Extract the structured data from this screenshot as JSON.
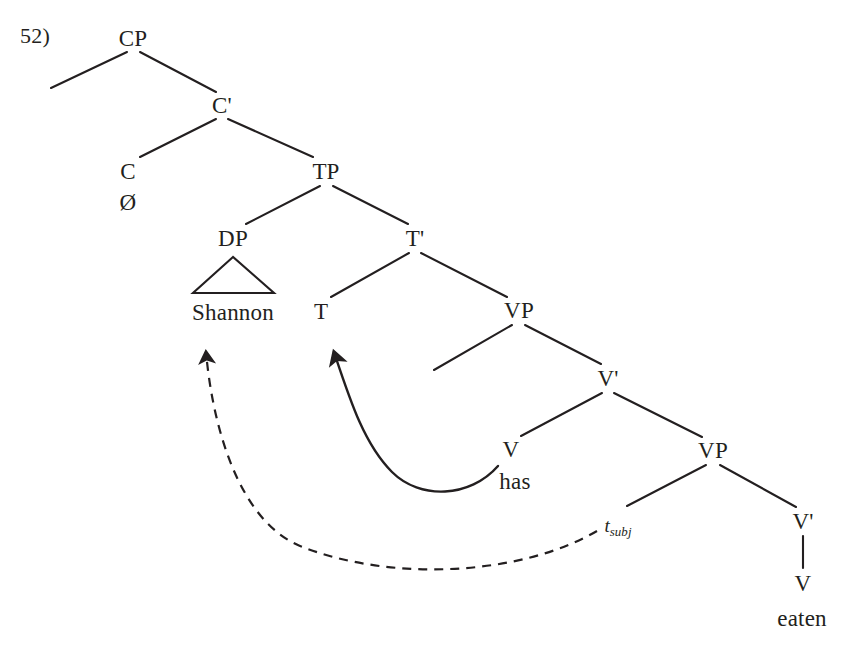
{
  "figure": {
    "example_number": "52)",
    "background_color": "#ffffff",
    "ink_color": "#231f20",
    "width": 843,
    "height": 660
  },
  "tree": {
    "nodes": [
      {
        "id": "cp",
        "label": "CP",
        "x": 133,
        "y": 38
      },
      {
        "id": "cbar",
        "label": "C'",
        "x": 222,
        "y": 105
      },
      {
        "id": "c",
        "label": "C",
        "x": 128,
        "y": 171
      },
      {
        "id": "c-null",
        "label": "Ø",
        "x": 128,
        "y": 202
      },
      {
        "id": "tp",
        "label": "TP",
        "x": 326,
        "y": 171
      },
      {
        "id": "dp",
        "label": "DP",
        "x": 233,
        "y": 238
      },
      {
        "id": "shannon",
        "label": "Shannon",
        "x": 233,
        "y": 312
      },
      {
        "id": "tbar",
        "label": "T'",
        "x": 415,
        "y": 238
      },
      {
        "id": "t",
        "label": "T",
        "x": 321,
        "y": 311
      },
      {
        "id": "vp1",
        "label": "VP",
        "x": 519,
        "y": 310
      },
      {
        "id": "vbar1",
        "label": "V'",
        "x": 608,
        "y": 378
      },
      {
        "id": "v1",
        "label": "V",
        "x": 511,
        "y": 449
      },
      {
        "id": "has",
        "label": "has",
        "x": 515,
        "y": 481
      },
      {
        "id": "vp2",
        "label": "VP",
        "x": 713,
        "y": 450
      },
      {
        "id": "t-subj",
        "label": "t",
        "subscript": "subj",
        "x": 618,
        "y": 526
      },
      {
        "id": "vbar2",
        "label": "V'",
        "x": 803,
        "y": 521
      },
      {
        "id": "v2",
        "label": "V",
        "x": 803,
        "y": 583
      },
      {
        "id": "eaten",
        "label": "eaten",
        "x": 802,
        "y": 618
      }
    ],
    "branches": [
      {
        "id": "cp-spec",
        "from": "cp",
        "to_point": [
          51,
          88
        ],
        "kind": "empty-specifier"
      },
      {
        "id": "cp-cbar",
        "from": "cp",
        "to": "cbar"
      },
      {
        "id": "cbar-c",
        "from": "cbar",
        "to": "c"
      },
      {
        "id": "cbar-tp",
        "from": "cbar",
        "to": "tp"
      },
      {
        "id": "tp-dp",
        "from": "tp",
        "to": "dp"
      },
      {
        "id": "tp-tbar",
        "from": "tp",
        "to": "tbar"
      },
      {
        "id": "tbar-t",
        "from": "tbar",
        "to": "t"
      },
      {
        "id": "tbar-vp1",
        "from": "tbar",
        "to": "vp1"
      },
      {
        "id": "vp1-spec",
        "from": "vp1",
        "to_point": [
          434,
          370
        ],
        "kind": "empty-specifier"
      },
      {
        "id": "vp1-vbar1",
        "from": "vp1",
        "to": "vbar1"
      },
      {
        "id": "vbar1-v1",
        "from": "vbar1",
        "to": "v1"
      },
      {
        "id": "vbar1-vp2",
        "from": "vbar1",
        "to": "vp2"
      },
      {
        "id": "vp2-trace",
        "from": "vp2",
        "to": "t-subj"
      },
      {
        "id": "vp2-vbar2",
        "from": "vp2",
        "to": "vbar2"
      },
      {
        "id": "vbar2-v2",
        "from": "vbar2",
        "to": "v2",
        "kind": "vertical"
      }
    ],
    "triangle": {
      "id": "dp-triangle",
      "apex": [
        233,
        257
      ],
      "base_left": [
        193,
        293
      ],
      "base_right": [
        274,
        293
      ]
    },
    "movement_arrows": [
      {
        "id": "head-movement-arrow",
        "style": "solid",
        "from_node": "v1",
        "to_node": "t",
        "description": "V has raises to T"
      },
      {
        "id": "subject-movement-arrow",
        "style": "dashed",
        "from_node": "t-subj",
        "to_node": "shannon",
        "description": "subject raises from Spec-VP to Spec-TP"
      }
    ]
  },
  "sentence": {
    "words": [
      "Shannon",
      "has",
      "eaten"
    ],
    "complementizer": "Ø",
    "trace": "t_subj"
  }
}
